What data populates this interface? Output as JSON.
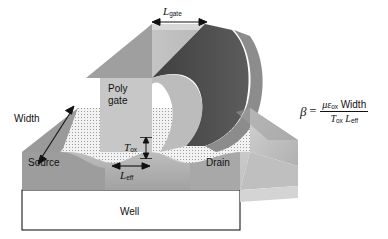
{
  "figure": {
    "background_color": "#ffffff",
    "ink_color": "#111111",
    "labels": {
      "l_gate": {
        "base": "L",
        "sub": "gate"
      },
      "poly_gate_line1": "Poly",
      "poly_gate_line2": "gate",
      "width": "Width",
      "source": "Source",
      "drain": "Drain",
      "well": "Well",
      "t_ox": {
        "base": "T",
        "sub": "ox"
      },
      "l_eff": {
        "base": "L",
        "sub": "eff"
      }
    },
    "formula": {
      "lhs": "β",
      "equals": "=",
      "numerator": {
        "mu": "μ",
        "epsilon": "ε",
        "epsilon_sub": "ox",
        "width": "Width"
      },
      "denominator": {
        "t": "T",
        "t_sub": "ox",
        "l": "L",
        "l_sub": "eff"
      },
      "plain_text": "β = μ εox Width / (Tox Leff)"
    },
    "palette": {
      "gate_top_light": "#c9c9c9",
      "gate_front_mid": "#b4b4b4",
      "gate_back_dark": "#4c4c4c",
      "gate_side_dark": "#5e5e5e",
      "oxide_dot_fill": "#efefef",
      "substrate_light": "#d5d5d5",
      "substrate_mid": "#aeaeae",
      "substrate_shadow": "#909090",
      "well_fill": "#ffffff",
      "outline": "#1a1a1a"
    },
    "annotations": [
      {
        "name": "l-gate-arrow",
        "type": "double-arrow",
        "orientation": "horizontal"
      },
      {
        "name": "width-arrow",
        "type": "double-arrow",
        "orientation": "diagonal"
      },
      {
        "name": "t-ox-arrow",
        "type": "double-arrow",
        "orientation": "vertical"
      },
      {
        "name": "l-eff-arrow",
        "type": "double-arrow",
        "orientation": "horizontal"
      }
    ]
  }
}
